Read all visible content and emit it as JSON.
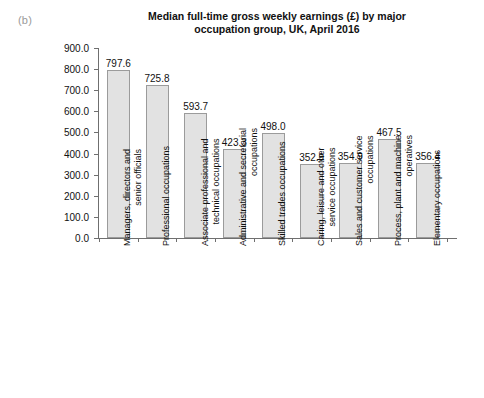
{
  "panel": {
    "label": "(b)"
  },
  "chart_data": {
    "type": "bar",
    "title": "Median full-time gross weekly earnings (£) by major occupation group, UK, April 2016",
    "title_lines": [
      "Median full-time gross weekly earnings (£) by major",
      "occupation group, UK, April 2016"
    ],
    "xlabel": "",
    "ylabel": "",
    "ylim": [
      0,
      900
    ],
    "ytick_step": 100,
    "ytick_labels": [
      "0.0",
      "100.0",
      "200.0",
      "300.0",
      "400.0",
      "500.0",
      "600.0",
      "700.0",
      "800.0",
      "900.0"
    ],
    "ytick_values": [
      0,
      100,
      200,
      300,
      400,
      500,
      600,
      700,
      800,
      900
    ],
    "grid": false,
    "legend": false,
    "bar_fill": "#e2e2e2",
    "bar_edge": "#9b9b9b",
    "axis_color": "#6f6f6f",
    "categories": [
      "Managers, directors and senior officials",
      "Professional occupations",
      "Associate professional and technical occupations",
      "Administrative and secretarial occupations",
      "Skilled trades occupations",
      "Caring, leisure and other service occupations",
      "Sales and customer service occupations",
      "Process, plant and machine operatives",
      "Elementary occupations"
    ],
    "category_lines": [
      [
        "Managers, directors and",
        "senior officials"
      ],
      [
        "Professional occupations"
      ],
      [
        "Associate professional and",
        "technical occupations"
      ],
      [
        "Administrative and secretarial",
        "occupations"
      ],
      [
        "Skilled trades occupations"
      ],
      [
        "Caring, leisure and other",
        "service occupations"
      ],
      [
        "Sales and customer service",
        "occupations"
      ],
      [
        "Process, plant and machine",
        "operatives"
      ],
      [
        "Elementary occupations"
      ]
    ],
    "values": [
      797.6,
      725.8,
      593.7,
      423.3,
      498.0,
      352.9,
      354.9,
      467.5,
      356.4
    ],
    "value_labels": [
      "797.6",
      "725.8",
      "593.7",
      "423.3",
      "498.0",
      "352.9",
      "354.9",
      "467.5",
      "356.4"
    ]
  }
}
